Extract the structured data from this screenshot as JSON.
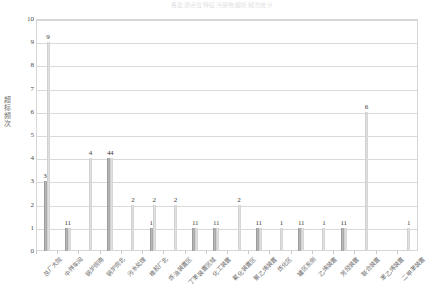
{
  "chart_data": {
    "type": "bar",
    "title": "各监测点位特征污染物超标频次统计",
    "xlabel": "",
    "ylabel": "超标频次",
    "ylim": [
      0,
      10
    ],
    "ytick_labels": [
      "0",
      "1",
      "2",
      "3",
      "4",
      "5",
      "6",
      "7",
      "8",
      "9",
      "10"
    ],
    "grid": true,
    "legend_position": "none",
    "categories": [
      "总厂大院",
      "中拌车间",
      "锅炉房南",
      "锅炉房北",
      "污水处理",
      "橡胶厂北",
      "炼油装置区",
      "丁苯装置区域",
      "化工装置",
      "氟化装置区",
      "聚乙烯装置",
      "炼化区",
      "罐区东侧",
      "乙烯装置",
      "芳烃装置",
      "联合装置",
      "苯乙烯装置",
      "二甲苯装置"
    ],
    "series": [
      {
        "name": "系列1",
        "color": "#a0a0a0",
        "values": [
          3,
          1,
          0,
          4,
          0,
          1,
          0,
          1,
          1,
          0,
          1,
          0,
          1,
          0,
          1,
          0,
          0,
          0
        ]
      },
      {
        "name": "系列2",
        "color": "#d2d2d2",
        "values": [
          9,
          1,
          4,
          4,
          2,
          2,
          2,
          1,
          1,
          2,
          1,
          1,
          1,
          1,
          1,
          6,
          0,
          1
        ]
      }
    ],
    "bar_labels": [
      [
        "3",
        "9"
      ],
      [
        "1",
        "1"
      ],
      [
        "",
        "4"
      ],
      [
        "4",
        "4"
      ],
      [
        "",
        "2"
      ],
      [
        "1",
        "2"
      ],
      [
        "",
        "2"
      ],
      [
        "1",
        "1"
      ],
      [
        "1",
        "1"
      ],
      [
        "",
        "2"
      ],
      [
        "1",
        "1"
      ],
      [
        "",
        "1"
      ],
      [
        "1",
        "1"
      ],
      [
        "",
        "1"
      ],
      [
        "1",
        "1"
      ],
      [
        "",
        "6"
      ],
      [
        "",
        ""
      ],
      [
        "",
        "1"
      ]
    ]
  }
}
